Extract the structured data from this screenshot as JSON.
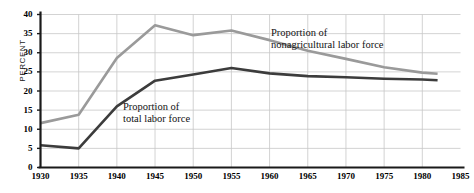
{
  "axes": {
    "ylabel": "PERCENT",
    "yticks": [
      0,
      5,
      10,
      15,
      20,
      25,
      30,
      35,
      40
    ],
    "xticks": [
      1930,
      1935,
      1940,
      1945,
      1950,
      1955,
      1960,
      1965,
      1970,
      1975,
      1980,
      1985
    ]
  },
  "annotations": {
    "nonagricultural": {
      "line1": "Proportion of",
      "line2": "nonagricultural labor force"
    },
    "total": {
      "line1": "Proportion of",
      "line2": "total labor force"
    }
  },
  "colors": {
    "nonagricultural": "#9a9a9a",
    "total": "#3c3c3c",
    "grid": "#c8c8c8",
    "axis": "#1a1a1a"
  },
  "chart_data": {
    "type": "line",
    "title": "",
    "xlabel": "",
    "ylabel": "PERCENT",
    "xlim": [
      1930,
      1985
    ],
    "ylim": [
      0,
      40
    ],
    "grid": true,
    "legend": "inline-annotations",
    "series": [
      {
        "name": "Proportion of nonagricultural labor force",
        "color": "#9a9a9a",
        "x": [
          1930,
          1935,
          1940,
          1945,
          1950,
          1955,
          1960,
          1965,
          1970,
          1975,
          1980,
          1982
        ],
        "values": [
          11.6,
          13.8,
          28.6,
          37.2,
          34.6,
          35.8,
          33.3,
          30.5,
          28.4,
          26.2,
          24.8,
          24.5
        ]
      },
      {
        "name": "Proportion of total labor force",
        "color": "#3c3c3c",
        "x": [
          1930,
          1935,
          1940,
          1945,
          1950,
          1955,
          1960,
          1965,
          1970,
          1975,
          1980,
          1982
        ],
        "values": [
          5.8,
          5.0,
          16.0,
          22.7,
          24.3,
          26.0,
          24.6,
          23.9,
          23.6,
          23.2,
          23.0,
          22.8
        ]
      }
    ]
  }
}
